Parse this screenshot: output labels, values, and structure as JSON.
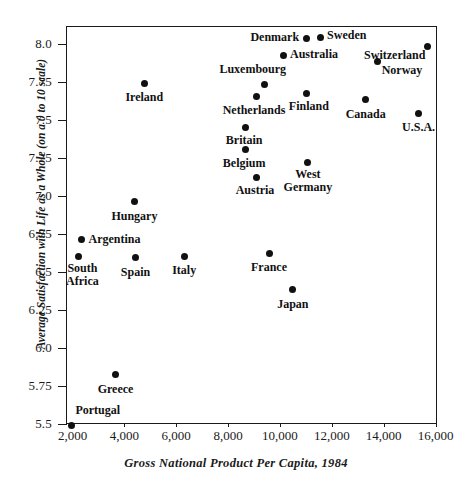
{
  "axes": {
    "y_title": "Average Satisfaction with Life as a Whole (on a 0 to 10 scale)",
    "x_title": "Gross National Product Per Capita, 1984",
    "y_ticks": [
      "8.0",
      "7.75",
      "7.5",
      "7.25",
      "7.0",
      "6.75",
      "6.5",
      "6.25",
      "6.0",
      "5.75",
      "5.5"
    ],
    "x_ticks": [
      "2,000",
      "4,000",
      "6,000",
      "8,000",
      "10,000",
      "12,000",
      "14,000",
      "16,000"
    ]
  },
  "chart_data": {
    "type": "scatter",
    "title": "",
    "xlabel": "Gross National Product Per Capita, 1984",
    "ylabel": "Average Satisfaction with Life as a Whole (on a 0 to 10 scale)",
    "xlim": [
      1730,
      16040
    ],
    "ylim": [
      5.5,
      8.13
    ],
    "xticks": [
      2000,
      4000,
      6000,
      8000,
      10000,
      12000,
      14000,
      16000
    ],
    "yticks": [
      5.5,
      5.75,
      6.0,
      6.25,
      6.5,
      6.75,
      7.0,
      7.25,
      7.5,
      7.75,
      8.0
    ],
    "grid": false,
    "legend": false,
    "marker": "filled-circle",
    "marker_color": "#111111",
    "points": [
      {
        "label": "Denmark",
        "x": 10970,
        "y": 8.04,
        "label_pos": "left-of-point"
      },
      {
        "label": "Sweden",
        "x": 11510,
        "y": 8.05,
        "label_pos": "right-of-point"
      },
      {
        "label": "Australia",
        "x": 10080,
        "y": 7.93,
        "label_pos": "right-of-point"
      },
      {
        "label": "Switzerland",
        "x": 15650,
        "y": 7.99,
        "label_pos": "below-left"
      },
      {
        "label": "Norway",
        "x": 13730,
        "y": 7.89,
        "label_pos": "below-right"
      },
      {
        "label": "Luxembourg",
        "x": 9350,
        "y": 7.74,
        "label_pos": "above-left"
      },
      {
        "label": "Finland",
        "x": 11000,
        "y": 7.68,
        "label_pos": "below"
      },
      {
        "label": "Netherlands",
        "x": 9040,
        "y": 7.66,
        "label_pos": "below"
      },
      {
        "label": "Canada",
        "x": 13270,
        "y": 7.64,
        "label_pos": "below"
      },
      {
        "label": "U.S.A.",
        "x": 15310,
        "y": 7.55,
        "label_pos": "below"
      },
      {
        "label": "Ireland",
        "x": 4730,
        "y": 7.75,
        "label_pos": "below"
      },
      {
        "label": "Britain",
        "x": 8620,
        "y": 7.46,
        "label_pos": "below"
      },
      {
        "label": "Belgium",
        "x": 8620,
        "y": 7.31,
        "label_pos": "below"
      },
      {
        "label": "West Germany",
        "x": 11040,
        "y": 7.23,
        "label_pos": "below"
      },
      {
        "label": "Austria",
        "x": 9040,
        "y": 7.13,
        "label_pos": "below"
      },
      {
        "label": "Hungary",
        "x": 4350,
        "y": 6.97,
        "label_pos": "below"
      },
      {
        "label": "Argentina",
        "x": 2310,
        "y": 6.72,
        "label_pos": "right-of-point"
      },
      {
        "label": "South Africa",
        "x": 2190,
        "y": 6.61,
        "label_pos": "below"
      },
      {
        "label": "Spain",
        "x": 4390,
        "y": 6.6,
        "label_pos": "below"
      },
      {
        "label": "Italy",
        "x": 6270,
        "y": 6.61,
        "label_pos": "below"
      },
      {
        "label": "France",
        "x": 9540,
        "y": 6.63,
        "label_pos": "below"
      },
      {
        "label": "Japan",
        "x": 10460,
        "y": 6.39,
        "label_pos": "below"
      },
      {
        "label": "Greece",
        "x": 3620,
        "y": 5.83,
        "label_pos": "below"
      },
      {
        "label": "Portugal",
        "x": 1920,
        "y": 5.5,
        "label_pos": "above-right"
      }
    ]
  },
  "layout": {
    "plot": {
      "left": 66,
      "top": 26,
      "width": 371,
      "height": 398
    },
    "x_map": {
      "value_a": 2000,
      "px_a": 72.5,
      "value_b": 16000,
      "px_b": 435.5
    },
    "y_map": {
      "value_a": 8.0,
      "px_a": 44,
      "value_b": 5.5,
      "px_b": 424
    },
    "label_offsets": {
      "below": {
        "dx": 0,
        "dy": 8,
        "align": "center"
      },
      "below-right": {
        "dx": 4,
        "dy": 7,
        "align": "left"
      },
      "below-left": {
        "dx": -3,
        "dy": 7,
        "align": "right"
      },
      "above-left": {
        "dx": 2,
        "dy": -20,
        "align": "right"
      },
      "above-right": {
        "dx": -4,
        "dy": -20,
        "align": "left"
      },
      "left-of-point": {
        "dx": -8,
        "dy": -7,
        "align": "right"
      },
      "right-of-point": {
        "dx": 8,
        "dy": -7,
        "align": "left"
      }
    },
    "label_overrides": {
      "Luxembourg": {
        "dx": 22,
        "dy": -22,
        "align": "right"
      },
      "Switzerland": {
        "dx": -2,
        "dy": 2,
        "align": "right"
      },
      "Norway": {
        "dx": 4,
        "dy": 2,
        "align": "left"
      },
      "Finland": {
        "dx": 2,
        "dy": 6,
        "align": "center"
      },
      "Netherlands": {
        "dx": -2,
        "dy": 7,
        "align": "center"
      },
      "Britain": {
        "dx": -1,
        "dy": 7,
        "align": "center"
      },
      "Belgium": {
        "dx": -1,
        "dy": 7,
        "align": "center"
      },
      "Austria": {
        "dx": -1,
        "dy": 7,
        "align": "center"
      },
      "West Germany": {
        "dx": 0,
        "dy": 6,
        "align": "center"
      },
      "South Africa": {
        "dx": 4,
        "dy": 6,
        "align": "center"
      },
      "Portugal": {
        "dx": 4,
        "dy": -21,
        "align": "left"
      },
      "Argentina": {
        "dx": 7,
        "dy": -7,
        "align": "left"
      },
      "Australia": {
        "dx": 7,
        "dy": -8,
        "align": "left"
      },
      "Denmark": {
        "dx": -7,
        "dy": -8,
        "align": "right"
      },
      "Sweden": {
        "dx": 7,
        "dy": -8,
        "align": "left"
      }
    }
  }
}
